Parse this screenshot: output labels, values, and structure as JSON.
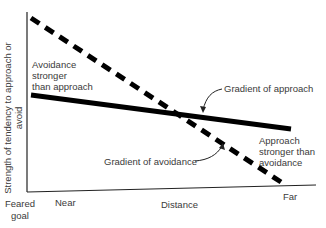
{
  "diagram": {
    "y_axis_label": "Strength of tendency to approach or avoid",
    "x_axis_label": "Distance",
    "x_ticks": {
      "origin": "Feared goal",
      "near": "Near",
      "far": "Far"
    },
    "annotations": {
      "avoidance_stronger": [
        "Avoidance",
        "stronger",
        "than approach"
      ],
      "approach_stronger": [
        "Approach",
        "stronger than",
        "avoidance"
      ],
      "gradient_approach": "Gradient of approach",
      "gradient_avoidance": "Gradient of avoidance"
    },
    "lines": [
      {
        "name": "Gradient of avoidance",
        "style": "dashed",
        "color": "#000000",
        "from": {
          "distance": "Feared goal",
          "strength": "high"
        },
        "to": {
          "distance": "Far",
          "strength": "near zero"
        }
      },
      {
        "name": "Gradient of approach",
        "style": "solid",
        "color": "#000000",
        "from": {
          "distance": "Feared goal",
          "strength": "moderate"
        },
        "to": {
          "distance": "Far",
          "strength": "moderate-low"
        }
      }
    ],
    "colors": {
      "line": "#000000",
      "text": "#3a3a3a",
      "axis": "#222222"
    }
  }
}
